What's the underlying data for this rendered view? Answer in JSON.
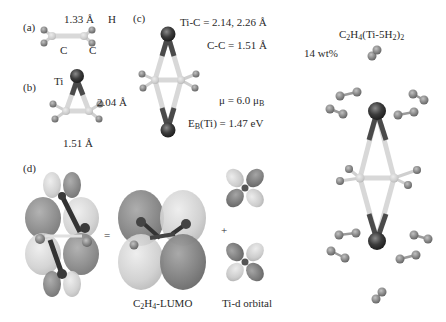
{
  "figure": {
    "panels": {
      "a": {
        "tag": "(a)",
        "bond_label": "1.33 Å",
        "atom_h": "H",
        "atom_c1": "C",
        "atom_c2": "C"
      },
      "b": {
        "tag": "(b)",
        "atom_ti": "Ti",
        "ti_c_bond": "2.04 Å",
        "c_c_bond": "1.51 Å"
      },
      "c": {
        "tag": "(c)",
        "ti_c_label": "Ti-C = 2.14, 2.26 Å",
        "c_c_label": "C-C = 1.51 Å",
        "moment_label": "μ = 6.0 μ",
        "moment_sub": "B",
        "binding_prefix": "E",
        "binding_sub": "B",
        "binding_rest": "(Ti) = 1.47 eV"
      },
      "hydrogen": {
        "title_c": "C",
        "title_2": "2",
        "title_h": "H",
        "title_4": "4",
        "title_mid": "(Ti-5H",
        "title_sub2": "2",
        "title_close": ")",
        "title_sub_outer": "2",
        "wt_label": "14 wt%"
      },
      "d": {
        "tag": "(d)",
        "equals": "=",
        "plus": "+",
        "lumo_c": "C",
        "lumo_2": "2",
        "lumo_h": "H",
        "lumo_4": "4",
        "lumo_rest": "-LUMO",
        "tid_label": "Ti-d orbital"
      }
    },
    "colors": {
      "ti_atom": "#3a3a3a",
      "c_atom": "#cfcfcf",
      "h_atom": "#8a8a8a",
      "bond_light": "#d8d8d8",
      "bond_dark": "#4a4a4a",
      "lobe_dark": "#7d7d7d",
      "lobe_light": "#c9c9c9",
      "h2_molecule": "#8f8f8f"
    }
  }
}
